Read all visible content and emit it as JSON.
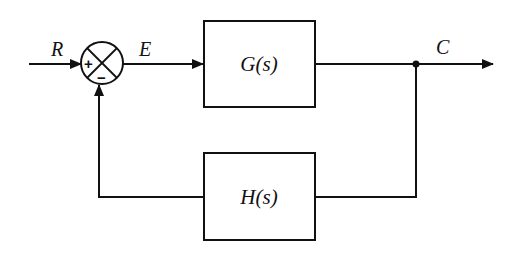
{
  "diagram": {
    "type": "feedback-control-block-diagram",
    "signals": {
      "input": "R",
      "error": "E",
      "output": "C"
    },
    "blocks": {
      "forward": {
        "label": "G(s)"
      },
      "feedback": {
        "label": "H(s)"
      }
    },
    "summing_junction": {
      "plus_sign": "+",
      "minus_sign": "−"
    }
  }
}
